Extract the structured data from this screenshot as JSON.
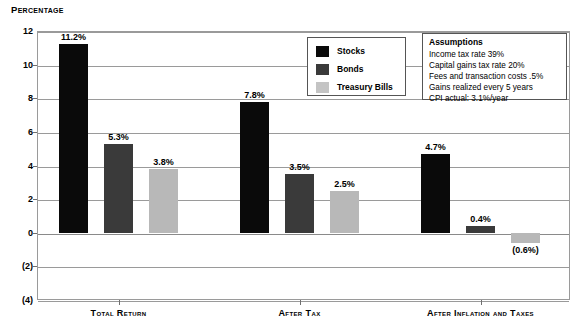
{
  "chart_data": {
    "type": "bar",
    "title": "",
    "ylabel": "Percentage",
    "xlabel": "",
    "ylim": [
      -4,
      12
    ],
    "yticks": [
      12,
      10,
      8,
      6,
      4,
      2,
      0,
      -2,
      -4
    ],
    "ytick_labels": [
      "12",
      "10",
      "8",
      "6",
      "4",
      "2",
      "0",
      "(2)",
      "(4)"
    ],
    "grid": true,
    "legend_position": "top-center",
    "categories": [
      "Total Return",
      "After Tax",
      "After Inflation and Taxes"
    ],
    "series": [
      {
        "name": "Stocks",
        "color": "#0a0a0a",
        "values": [
          11.2,
          7.8,
          4.7
        ],
        "labels": [
          "11.2%",
          "7.8%",
          "4.7%"
        ]
      },
      {
        "name": "Bonds",
        "color": "#3a3a3a",
        "values": [
          5.3,
          3.5,
          0.4
        ],
        "labels": [
          "5.3%",
          "3.5%",
          "0.4%"
        ]
      },
      {
        "name": "Treasury Bills",
        "color": "#b8b8b8",
        "values": [
          3.8,
          2.5,
          -0.6
        ],
        "labels": [
          "3.8%",
          "2.5%",
          "(0.6%)"
        ]
      }
    ]
  },
  "axis": {
    "title": "Percentage"
  },
  "legend": {
    "items": [
      {
        "label": "Stocks"
      },
      {
        "label": "Bonds"
      },
      {
        "label": "Treasury Bills"
      }
    ]
  },
  "assumptions": {
    "title": "Assumptions",
    "lines": [
      "Income tax rate 39%",
      "Capital gains tax rate 20%",
      "Fees and transaction costs .5%",
      "Gains realized every 5 years",
      "CPI actual: 3.1%/year"
    ]
  }
}
